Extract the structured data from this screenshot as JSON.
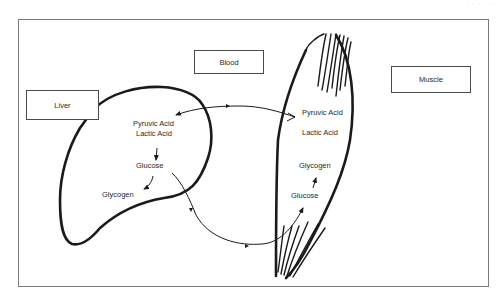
{
  "header": {
    "text": "· · · · · · ·"
  },
  "boxes": {
    "liver": "Liver",
    "blood": "Blood",
    "muscle": "Muscle"
  },
  "liver_labels": {
    "pyruvic_acid": "Pyruvic Acid",
    "lactic_acid": "Lactic Acid",
    "glucose": "Glucose",
    "glycogen": "Glycogen"
  },
  "muscle_labels": {
    "pyruvic_acid": "Pyruvic Acid",
    "lactic_acid": "Lactic Acid",
    "glycogen": "Glycogen",
    "glucose": "Glucose"
  },
  "colors": {
    "ink": "#1a1a1a",
    "frame": "#7a7a7a",
    "background": "#ffffff"
  }
}
